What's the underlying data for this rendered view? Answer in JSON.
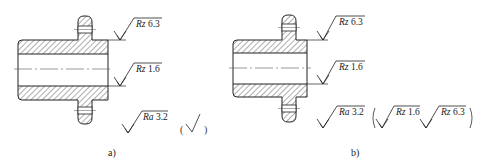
{
  "figure": {
    "type": "engineering-drawing",
    "colors": {
      "line": "#222222",
      "hatch": "#333333",
      "centerline": "#555555",
      "background": "#ffffff"
    }
  },
  "view_a": {
    "caption": "a)",
    "symbols": [
      {
        "param": "Rz",
        "value": "6.3",
        "position": "outer-cylinder"
      },
      {
        "param": "Rz",
        "value": "1.6",
        "position": "bore"
      },
      {
        "param": "Ra",
        "value": "3.2",
        "position": "general-other-surfaces"
      }
    ],
    "simplified_note": {
      "open_paren": "(",
      "close_paren": ")",
      "icon": "basic-roughness-check"
    }
  },
  "view_b": {
    "caption": "b)",
    "symbols": [
      {
        "param": "Rz",
        "value": "6.3",
        "position": "outer-cylinder"
      },
      {
        "param": "Rz",
        "value": "1.6",
        "position": "bore"
      },
      {
        "param": "Ra",
        "value": "3.2",
        "position": "general-other-surfaces"
      }
    ],
    "bracket_note": {
      "open_paren": "(",
      "close_paren": ")",
      "items": [
        {
          "param": "Rz",
          "value": "1.6"
        },
        {
          "param": "Rz",
          "value": "6.3"
        }
      ]
    }
  }
}
